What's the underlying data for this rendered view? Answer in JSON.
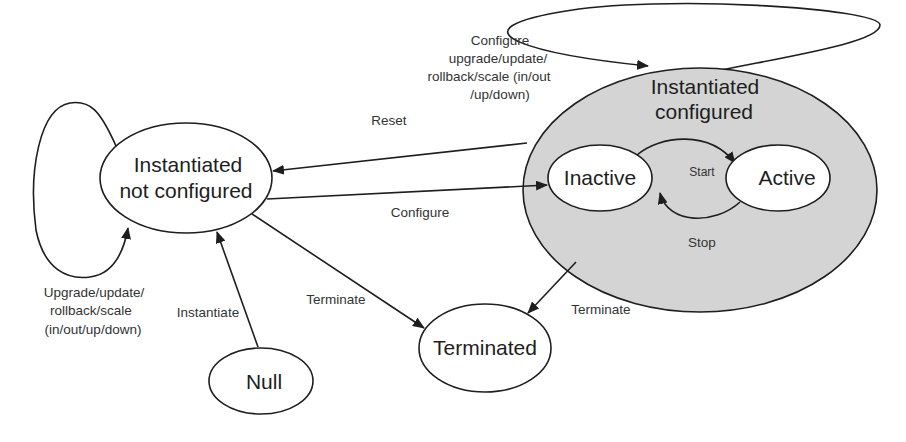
{
  "diagram": {
    "type": "state-machine",
    "colors": {
      "line": "#1e1e1e",
      "container_fill": "#d4d4d4",
      "node_fill": "#ffffff",
      "text": "#1e1e1e"
    },
    "nodes": {
      "not_configured": {
        "line1": "Instantiated",
        "line2": "not configured"
      },
      "configured": {
        "line1": "Instantiated",
        "line2": "configured"
      },
      "inactive": {
        "label": "Inactive"
      },
      "active": {
        "label": "Active"
      },
      "terminated": {
        "label": "Terminated"
      },
      "null": {
        "label": "Null"
      }
    },
    "edges": {
      "reset": {
        "label": "Reset"
      },
      "configure": {
        "label": "Configure"
      },
      "terminate_from_not_configured": {
        "label": "Terminate"
      },
      "terminate_from_configured": {
        "label": "Terminate"
      },
      "instantiate": {
        "label": "Instantiate"
      },
      "start": {
        "label": "Start"
      },
      "stop": {
        "label": "Stop"
      },
      "self_loop_not_configured": {
        "line1": "Upgrade/update/",
        "line2": "rollback/scale",
        "line3": "(in/out/up/down)"
      },
      "self_loop_configured": {
        "line1": "Configure",
        "line2": "upgrade/update/",
        "line3": "rollback/scale (in/out",
        "line4": "/up/down)"
      }
    }
  }
}
